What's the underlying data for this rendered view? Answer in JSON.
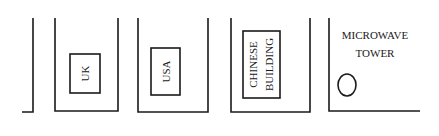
{
  "diagram": {
    "compartments": [
      {
        "id": "partial-left"
      },
      {
        "id": "uk",
        "label": "UK"
      },
      {
        "id": "usa",
        "label": "USA"
      },
      {
        "id": "chinese-building",
        "label_line1": "CHINESE",
        "label_line2": "BUILDING"
      },
      {
        "id": "microwave-tower",
        "label_line1": "MICROWAVE",
        "label_line2": "TOWER"
      }
    ],
    "colors": {
      "line": "#1a1a1a",
      "background": "#ffffff"
    }
  }
}
